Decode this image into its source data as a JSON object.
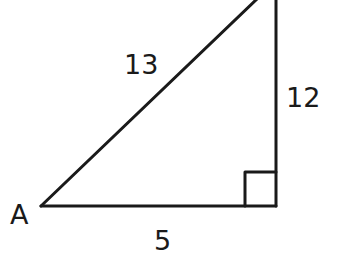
{
  "diagram": {
    "type": "right-triangle",
    "stroke_color": "#1a1a1a",
    "vertices": {
      "A": {
        "label": "A",
        "x": 41,
        "y": 206
      },
      "right_angle": {
        "x": 276,
        "y": 206
      },
      "top": {
        "x": 276,
        "y": -2
      }
    },
    "sides": {
      "hypotenuse": {
        "label": "13"
      },
      "vertical": {
        "label": "12"
      },
      "base": {
        "label": "5"
      }
    },
    "right_angle_marker": {
      "size": 31
    }
  }
}
